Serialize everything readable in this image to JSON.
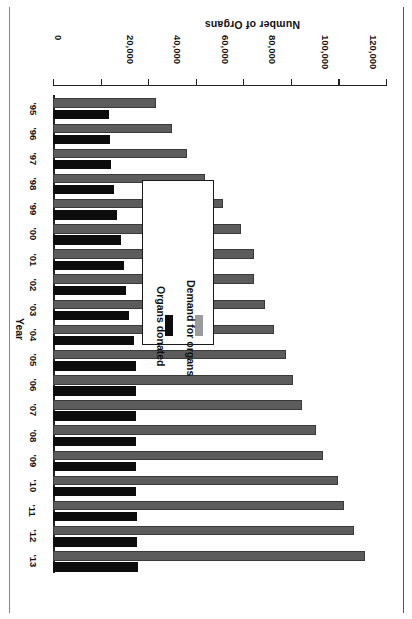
{
  "chart_data": {
    "type": "bar",
    "orientation": "horizontal",
    "title": "",
    "xlabel": "Number of Organs",
    "ylabel": "Year",
    "categories": [
      "'95",
      "'96",
      "'97",
      "'98",
      "'99",
      "'00",
      "'01",
      "'02",
      "'03",
      "'04",
      "'05",
      "'06",
      "'07",
      "'08",
      "'09",
      "'10",
      "'11",
      "'12",
      "'13"
    ],
    "series": [
      {
        "name": "Demand for organs",
        "color": "#5c5c5c",
        "values": [
          43500,
          50000,
          56500,
          64000,
          71500,
          79000,
          84500,
          84500,
          89000,
          93000,
          98000,
          101000,
          104500,
          110500,
          113500,
          120000,
          122500,
          126500,
          131000
        ]
      },
      {
        "name": "Organs donated",
        "color": "#0c0c0c",
        "values": [
          23500,
          24000,
          24500,
          25500,
          27000,
          28500,
          30000,
          30500,
          32000,
          34000,
          35000,
          35000,
          35000,
          35000,
          35000,
          35000,
          35500,
          35500,
          35600
        ]
      }
    ],
    "xlim": [
      0,
      140000
    ],
    "xticks": [
      0,
      20000,
      40000,
      60000,
      80000,
      100000,
      120000,
      140000
    ],
    "xtick_labels": [
      "0",
      "20,000",
      "40,000",
      "60,000",
      "80,000",
      "100,000",
      "120,000",
      "140,000"
    ],
    "grid": false,
    "legend_position": "inside-left-lower"
  },
  "axes": {
    "value_axis_title": "Number of Organs",
    "category_axis_title": "Year"
  },
  "legend": {
    "items": [
      {
        "label": "Demand for organs",
        "swatch": "gray-swatch"
      },
      {
        "label": "Organs donated",
        "swatch": "black-swatch"
      }
    ]
  }
}
